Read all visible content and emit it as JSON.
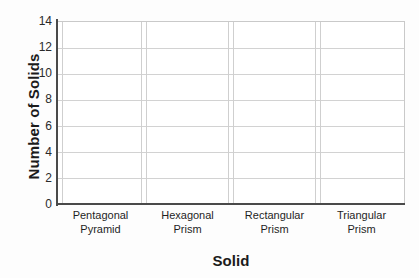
{
  "chart_data": {
    "type": "bar",
    "title": "",
    "subtitle": "",
    "xlabel": "Solid",
    "ylabel": "Number of Solids",
    "categories": [
      "Pentagonal Pyramid",
      "Hexagonal Prism",
      "Rectangular Prism",
      "Triangular Prism"
    ],
    "category_lines": [
      [
        "Pentagonal",
        "Pyramid"
      ],
      [
        "Hexagonal",
        "Prism"
      ],
      [
        "Rectangular",
        "Prism"
      ],
      [
        "Triangular",
        "Prism"
      ]
    ],
    "values": [
      0,
      0,
      0,
      0
    ],
    "ylim": [
      0,
      14
    ],
    "ytick_step": 2,
    "yticks": [
      0,
      2,
      4,
      6,
      8,
      10,
      12,
      14
    ],
    "grid": true,
    "grid_axis": "both",
    "legend": false,
    "legend_position": "none",
    "note": "blank worksheet-style bar graph; no bars plotted"
  },
  "style": {
    "background": "#fdfdfd",
    "plot_background": "#ffffff",
    "axis_line_color": "#4a4a4a",
    "grid_color": "#d2d2d2",
    "separator_color": "#cfcfcf",
    "text_color": "#1b1b1b",
    "bar_color": "#7aa7d8"
  }
}
